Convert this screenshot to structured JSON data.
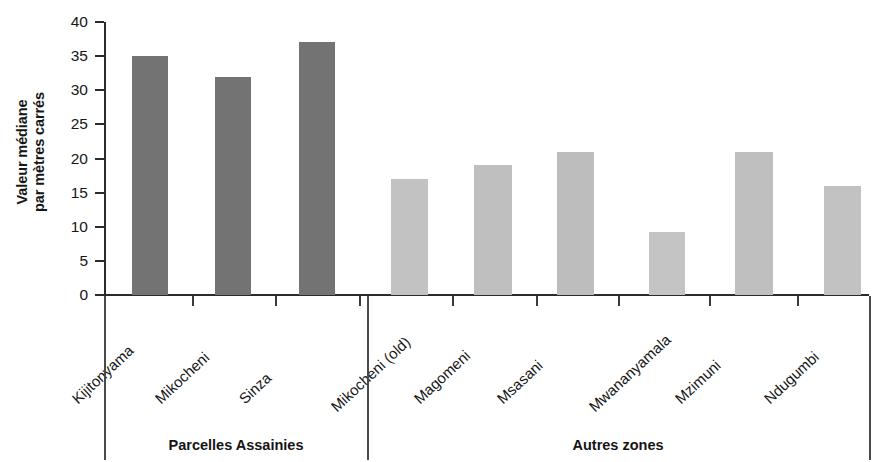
{
  "chart_data": {
    "type": "bar",
    "title": "",
    "subtitle": "",
    "xlabel": "",
    "ylabel": "Valeur médiane par mètres carrés",
    "ylabel_lines": [
      "Valeur médiane",
      "par mètres carrés"
    ],
    "ylim": [
      0,
      40
    ],
    "ytick_step": 5,
    "yticks": [
      0,
      5,
      10,
      15,
      20,
      25,
      30,
      35,
      40
    ],
    "ytick_labels": [
      "0",
      "5",
      "10",
      "15",
      "20",
      "25",
      "30",
      "35",
      "40"
    ],
    "grid": false,
    "legend_position": "none",
    "categories": [
      "Kijitonyama",
      "Mikocheni",
      "Sinza",
      "Mikocheni (old)",
      "Magomeni",
      "Msasani",
      "Mwananyamala",
      "Mzimuni",
      "Ndugumbi"
    ],
    "values": [
      35,
      32,
      37,
      17,
      19,
      21,
      9.3,
      21,
      16
    ],
    "bar_colors": [
      "#737373",
      "#737373",
      "#737373",
      "#c2c2c2",
      "#bfbfbf",
      "#bdbdbd",
      "#c4c4c4",
      "#bfbfbf",
      "#c2c2c2"
    ],
    "groups": [
      {
        "label": "Parcelles Assainies",
        "categories": [
          "Kijitonyama",
          "Mikocheni",
          "Sinza"
        ]
      },
      {
        "label": "Autres zones",
        "categories": [
          "Mikocheni (old)",
          "Magomeni",
          "Msasani",
          "Mwananyamala",
          "Mzimuni",
          "Ndugumbi"
        ]
      }
    ],
    "group_colors": {
      "Parcelles Assainies": "#737373",
      "Autres zones": "#c2c2c2"
    },
    "axis_color": "#2b2b2b"
  }
}
